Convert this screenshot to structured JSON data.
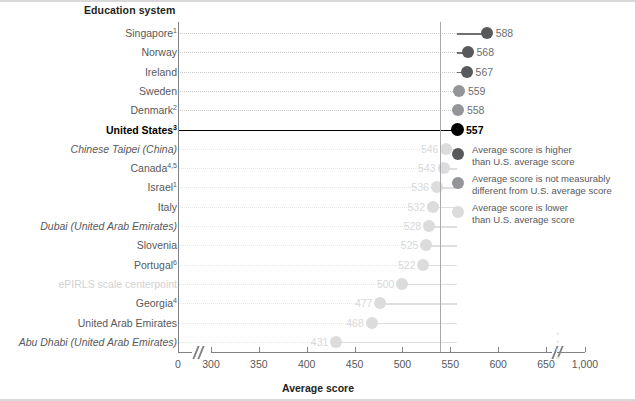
{
  "chart_data": {
    "type": "bar",
    "orientation": "horizontal-lollipop",
    "title": "",
    "column_header": "Education system",
    "xlabel": "Average score",
    "ylabel": "",
    "xlim": [
      0,
      1000
    ],
    "x_ticks": [
      "0",
      "300",
      "350",
      "400",
      "450",
      "500",
      "550",
      "600",
      "650",
      "1,000"
    ],
    "x_tick_values": [
      0,
      300,
      350,
      400,
      450,
      500,
      550,
      600,
      650,
      1000
    ],
    "axis_breaks": [
      {
        "between": [
          0,
          300
        ]
      },
      {
        "between": [
          650,
          1000
        ]
      }
    ],
    "reference_line_value": 557,
    "reference_line_label": "United States",
    "grid": false,
    "categories": [
      "Singapore",
      "Norway",
      "Ireland",
      "Sweden",
      "Denmark",
      "United States",
      "Chinese Taipei (China)",
      "Canada",
      "Israel",
      "Italy",
      "Dubai (United Arab Emirates)",
      "Slovenia",
      "Portugal",
      "ePIRLS scale centerpoint",
      "Georgia",
      "United Arab Emirates",
      "Abu Dhabi (United Arab Emirates)"
    ],
    "values": [
      588,
      568,
      567,
      559,
      558,
      557,
      546,
      543,
      536,
      532,
      528,
      525,
      522,
      500,
      477,
      468,
      431
    ],
    "rows": [
      {
        "label": "Singapore",
        "sup": "1",
        "value": 588,
        "value_text": "588",
        "status": "higher",
        "style": "normal"
      },
      {
        "label": "Norway",
        "sup": "",
        "value": 568,
        "value_text": "568",
        "status": "higher",
        "style": "normal"
      },
      {
        "label": "Ireland",
        "sup": "",
        "value": 567,
        "value_text": "567",
        "status": "higher",
        "style": "normal"
      },
      {
        "label": "Sweden",
        "sup": "",
        "value": 559,
        "value_text": "559",
        "status": "same",
        "style": "normal"
      },
      {
        "label": "Denmark",
        "sup": "2",
        "value": 558,
        "value_text": "558",
        "status": "same",
        "style": "normal"
      },
      {
        "label": "United States",
        "sup": "3",
        "value": 557,
        "value_text": "557",
        "status": "us",
        "style": "bold"
      },
      {
        "label": "Chinese Taipei (China)",
        "sup": "",
        "value": 546,
        "value_text": "546",
        "status": "lower",
        "style": "italic"
      },
      {
        "label": "Canada",
        "sup": "4,5",
        "value": 543,
        "value_text": "543",
        "status": "lower",
        "style": "normal"
      },
      {
        "label": "Israel",
        "sup": "1",
        "value": 536,
        "value_text": "536",
        "status": "lower",
        "style": "normal"
      },
      {
        "label": "Italy",
        "sup": "",
        "value": 532,
        "value_text": "532",
        "status": "lower",
        "style": "normal"
      },
      {
        "label": "Dubai (United Arab Emirates)",
        "sup": "",
        "value": 528,
        "value_text": "528",
        "status": "lower",
        "style": "italic"
      },
      {
        "label": "Slovenia",
        "sup": "",
        "value": 525,
        "value_text": "525",
        "status": "lower",
        "style": "normal"
      },
      {
        "label": "Portugal",
        "sup": "6",
        "value": 522,
        "value_text": "522",
        "status": "lower",
        "style": "normal"
      },
      {
        "label": "ePIRLS scale centerpoint",
        "sup": "",
        "value": 500,
        "value_text": "500",
        "status": "lower",
        "style": "faint"
      },
      {
        "label": "Georgia",
        "sup": "4",
        "value": 477,
        "value_text": "477",
        "status": "lower",
        "style": "normal"
      },
      {
        "label": "United Arab Emirates",
        "sup": "",
        "value": 468,
        "value_text": "468",
        "status": "lower",
        "style": "normal"
      },
      {
        "label": "Abu Dhabi (United Arab Emirates)",
        "sup": "",
        "value": 431,
        "value_text": "431",
        "status": "lower",
        "style": "italic"
      }
    ],
    "legend": {
      "position": "right-middle",
      "entries": [
        {
          "status": "higher",
          "line1": "Average score is higher",
          "line2": "than U.S. average score",
          "color": "#58595b"
        },
        {
          "status": "same",
          "line1": "Average score is not measurably",
          "line2": "different from U.S. average score",
          "color": "#939598"
        },
        {
          "status": "lower",
          "line1": "Average score is lower",
          "line2": "than U.S. average score",
          "color": "#dcdcdc"
        }
      ]
    },
    "colors": {
      "higher": "#58595b",
      "same": "#939598",
      "lower": "#dcdcdc",
      "us": "#000000",
      "axis": "#808285",
      "text": "#58595b"
    }
  }
}
